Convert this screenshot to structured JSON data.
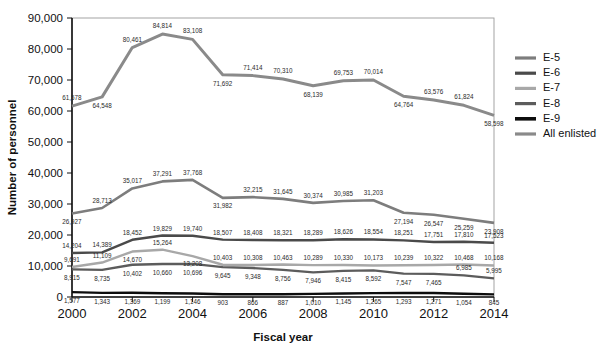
{
  "chart_data": {
    "type": "line",
    "title": "",
    "xlabel": "Fiscal year",
    "ylabel": "Number of personnel",
    "x": [
      2000,
      2001,
      2002,
      2003,
      2004,
      2005,
      2006,
      2007,
      2008,
      2009,
      2010,
      2011,
      2012,
      2013,
      2014
    ],
    "xtick_labels": [
      "2000",
      "2002",
      "2004",
      "2006",
      "2008",
      "2010",
      "2012",
      "2014"
    ],
    "xticks": [
      2000,
      2002,
      2004,
      2006,
      2008,
      2010,
      2012,
      2014
    ],
    "xlim": [
      2000,
      2014
    ],
    "ylim": [
      0,
      90000
    ],
    "yticks": [
      0,
      10000,
      20000,
      30000,
      40000,
      50000,
      60000,
      70000,
      80000,
      90000
    ],
    "ytick_labels": [
      "0",
      "10,000",
      "20,000",
      "30,000",
      "40,000",
      "50,000",
      "60,000",
      "70,000",
      "80,000",
      "90,000"
    ],
    "grid": false,
    "legend_position": "right",
    "series": [
      {
        "name": "E-5",
        "color": "#7d7d7d",
        "width": 2.6,
        "label_dy": [
          10,
          -5,
          -5,
          -5,
          -5,
          10,
          -5,
          -5,
          -5,
          -5,
          -5,
          11,
          11,
          11,
          11
        ],
        "values": [
          26927,
          28713,
          35017,
          37291,
          37768,
          31982,
          32215,
          31645,
          30374,
          30985,
          31203,
          27194,
          26547,
          25259,
          23908
        ],
        "value_labels": [
          "26,927",
          "28,713",
          "35,017",
          "37,291",
          "37,768",
          "31,982",
          "32,215",
          "31,645",
          "30,374",
          "30,985",
          "31,203",
          "27,194",
          "26,547",
          "25,259",
          "23,908"
        ]
      },
      {
        "name": "E-6",
        "color": "#4a4a4a",
        "width": 2.4,
        "label_dy": [
          -5,
          -5,
          -5,
          -5,
          -5,
          -5,
          -5,
          -5,
          -5,
          -5,
          -5,
          -5,
          -5,
          -5,
          -5
        ],
        "values": [
          14204,
          14389,
          18452,
          19829,
          19740,
          18507,
          18408,
          18321,
          18289,
          18626,
          18554,
          18251,
          17751,
          17810,
          17523
        ],
        "value_labels": [
          "14,204",
          "14,389",
          "18,452",
          "19,829",
          "19,740",
          "18,507",
          "18,408",
          "18,321",
          "18,289",
          "18,626",
          "18,554",
          "18,251",
          "17,751",
          "17,810",
          "17,523"
        ]
      },
      {
        "name": "E-7",
        "color": "#a8a8a8",
        "width": 2.4,
        "label_dy": [
          -5,
          -5,
          10,
          -5,
          10,
          -5,
          -5,
          -5,
          -5,
          -5,
          -5,
          -5,
          -5,
          -5,
          -5
        ],
        "values": [
          9691,
          11109,
          14670,
          15264,
          13208,
          10403,
          10308,
          10463,
          10289,
          10330,
          10173,
          10239,
          10322,
          10468,
          10168
        ],
        "value_labels": [
          "9,691",
          "11,109",
          "14,670",
          "15,264",
          "13,208",
          "10,403",
          "10,308",
          "10,463",
          "10,289",
          "10,330",
          "10,173",
          "10,239",
          "10,322",
          "10,468",
          "10,168"
        ]
      },
      {
        "name": "E-8",
        "color": "#5c5c5c",
        "width": 2.4,
        "label_dy": [
          11,
          11,
          11,
          11,
          11,
          11,
          11,
          11,
          11,
          11,
          11,
          11,
          11,
          -5,
          -5
        ],
        "values": [
          8915,
          8735,
          10402,
          10660,
          10696,
          9645,
          9348,
          8756,
          7946,
          8415,
          8592,
          7547,
          7465,
          6985,
          5995
        ],
        "value_labels": [
          "8,915",
          "8,735",
          "10,402",
          "10,660",
          "10,696",
          "9,645",
          "9,348",
          "8,756",
          "7,946",
          "8,415",
          "8,592",
          "7,547",
          "7,465",
          "6,985",
          "5,995"
        ]
      },
      {
        "name": "E-9",
        "color": "#0d0d0d",
        "width": 2.4,
        "label_dy": [
          11,
          11,
          11,
          11,
          11,
          11,
          11,
          11,
          11,
          11,
          11,
          11,
          11,
          11,
          11
        ],
        "values": [
          1577,
          1343,
          1369,
          1199,
          1146,
          903,
          866,
          887,
          1010,
          1145,
          1265,
          1293,
          1271,
          1054,
          845
        ],
        "value_labels": [
          "1,577",
          "1,343",
          "1,369",
          "1,199",
          "1,146",
          "903",
          "866",
          "887",
          "1,010",
          "1,145",
          "1,265",
          "1,293",
          "1,271",
          "1,054",
          "845"
        ]
      },
      {
        "name": "All enlisted",
        "color": "#8a8a8a",
        "width": 3.0,
        "label_dy": [
          -6,
          11,
          -6,
          -6,
          -6,
          11,
          -6,
          -6,
          11,
          -6,
          -6,
          11,
          -6,
          -6,
          11
        ],
        "values": [
          61578,
          64548,
          80461,
          84814,
          83108,
          71692,
          71414,
          70310,
          68139,
          69753,
          70014,
          64764,
          63576,
          61824,
          58598
        ],
        "value_labels": [
          "61,578",
          "64,548",
          "80,461",
          "84,814",
          "83,108",
          "71,692",
          "71,414",
          "70,310",
          "68,139",
          "69,753",
          "70,014",
          "64,764",
          "63,576",
          "61,824",
          "58,598"
        ]
      }
    ]
  },
  "legend": {
    "items": [
      {
        "label": "E-5",
        "color": "#7d7d7d",
        "width": 3.2
      },
      {
        "label": "E-6",
        "color": "#4a4a4a",
        "width": 3.2
      },
      {
        "label": "E-7",
        "color": "#a8a8a8",
        "width": 3.2
      },
      {
        "label": "E-8",
        "color": "#5c5c5c",
        "width": 3.2
      },
      {
        "label": "E-9",
        "color": "#0d0d0d",
        "width": 3.6
      },
      {
        "label": "All enlisted",
        "color": "#8a8a8a",
        "width": 3.2
      }
    ]
  }
}
